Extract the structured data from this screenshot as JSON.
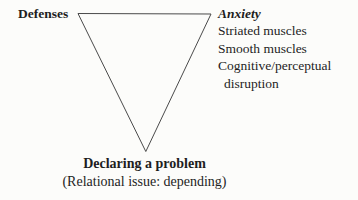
{
  "diagram": {
    "left_label": "Defenses",
    "right": {
      "title": "Anxiety",
      "items": [
        "Striated muscles",
        "Smooth muscles",
        "Cognitive/perceptual disruption"
      ]
    },
    "bottom": {
      "title": "Declaring a problem",
      "subtitle": "(Relational issue: depending)"
    },
    "colors": {
      "text": "#1e1e1e",
      "line": "#4a4a4a",
      "background": "#fcfcfa"
    }
  }
}
